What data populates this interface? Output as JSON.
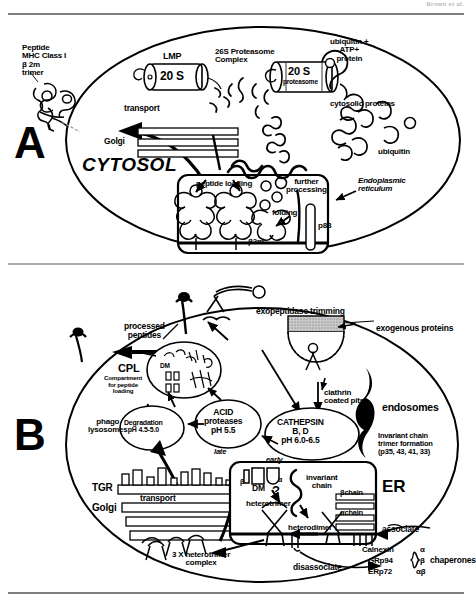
{
  "figure": {
    "header_note": "Brown et al.",
    "panels": [
      {
        "id": "A",
        "letter": "A",
        "topic": "MHC Class I antigen processing pathway"
      },
      {
        "id": "B",
        "letter": "B",
        "topic": "MHC Class II antigen processing pathway"
      }
    ]
  },
  "panelA": {
    "letter": "A",
    "cytosol_label": "CYTOSOL",
    "peptide_trimer": "Peptide\nMHC Class I\nβ 2m\ntrimer",
    "lmp": "LMP",
    "lmp_core": "20 S",
    "proteasome_complex": "26S Proteasome\nComplex",
    "proteasome_core_top": "20 S",
    "proteasome_core_bottom": "proteasome",
    "ubiquitin_atp": "ubiquitin +\nATP+\nprotein",
    "cytosolic_proteins": "cytosolic proteins",
    "ubiquitin": "ubiquitin",
    "transport": "transport",
    "golgi": "Golgi",
    "peptide_loading": "peptide loading",
    "further_processing": "further\nprocessing",
    "endoplasmic_reticulum": "Endoplasmic\nreticulum",
    "folding": "folding",
    "b2m": "β2m",
    "p88": "p88"
  },
  "panelB": {
    "letter": "B",
    "exopeptidase_trimming": "exopeptidase trimming",
    "exogenous_proteins": "exogenous proteins",
    "processed_peptides": "processed\npeptides",
    "clathrin_coated_pits": "clathrin\ncoated pits",
    "endosomes": "endosomes",
    "cpl_abbrev": "CPL",
    "cpl_full": "Compartment\nfor peptide\nloading",
    "cpl_dm": "DM",
    "phago_lysosomes": "phago\nlysosomes",
    "degradation": "Degradation\npH 4.5-5.0",
    "acid_proteases": "ACID\nproteases\npH 5.5",
    "late": "late",
    "cathepsin": "CATHEPSIN\nB, D\npH 6.0-6.5",
    "early": "early",
    "invariant_chain_trimer": "Invariant chain\ntrimer formation\n(p35, 43, 41, 33)",
    "tgr": "TGR",
    "golgi": "Golgi",
    "transport": "transport",
    "er": "ER",
    "dm": "DM",
    "dm_beta": "β",
    "dm_alpha": "α",
    "dm_question": "?",
    "invariant_chain": "invariant\nchain",
    "beta_chain": "βchain",
    "alpha_chain": "αchain",
    "heterotrimer": "heterotrimer",
    "heterodimer": "heterodimer",
    "three_x_heterotrimer": "3 X heterotrimer\ncomplex",
    "associate": "associate",
    "disassociate": "disassociate",
    "chaperone_names": [
      "Calnexin",
      "GRp94",
      "ERp72"
    ],
    "chaperone_subunits": [
      "α",
      "β",
      "αβ"
    ],
    "chaperones_label": "chaperones"
  },
  "colors": {
    "ink": "#000000",
    "paper": "#ffffff",
    "rule": "#555555",
    "shade": "#9a9a9a",
    "faint": "#b9b9bd"
  }
}
